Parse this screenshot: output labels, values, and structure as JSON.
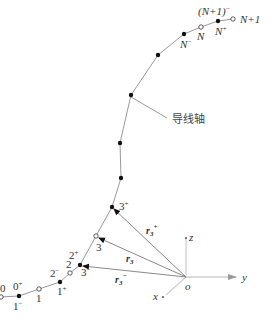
{
  "diagram": {
    "axis_label": "导线轴",
    "colors": {
      "line": "#9a9a9a",
      "node_filled": "#111111",
      "node_open": "#ffffff",
      "text": "#333333",
      "axis": "#cfcfcf"
    },
    "nodes": [
      {
        "id": "0",
        "type": "open",
        "labels": [
          "0"
        ]
      },
      {
        "id": "0p1m",
        "type": "filled",
        "labels": [
          "0",
          "+",
          "1",
          "−"
        ]
      },
      {
        "id": "1",
        "type": "open",
        "labels": [
          "1"
        ]
      },
      {
        "id": "1p2m",
        "type": "filled",
        "labels": [
          "1",
          "+",
          "2",
          "−"
        ]
      },
      {
        "id": "2",
        "type": "open",
        "labels": [
          "2"
        ]
      },
      {
        "id": "2p3m",
        "type": "filled",
        "labels": [
          "2",
          "+",
          "3",
          "−"
        ]
      },
      {
        "id": "3",
        "type": "open",
        "labels": [
          "3"
        ]
      },
      {
        "id": "3p",
        "type": "filled",
        "labels": [
          "3",
          "+"
        ]
      },
      {
        "id": "m1",
        "type": "filled",
        "labels": []
      },
      {
        "id": "m2",
        "type": "filled",
        "labels": []
      },
      {
        "id": "m3",
        "type": "filled",
        "labels": []
      },
      {
        "id": "m4",
        "type": "filled",
        "labels": []
      },
      {
        "id": "Nm",
        "type": "filled",
        "labels": [
          "N",
          "−"
        ]
      },
      {
        "id": "N",
        "type": "open",
        "labels": [
          "N"
        ]
      },
      {
        "id": "Np",
        "type": "filled",
        "labels": [
          "N",
          "+"
        ]
      },
      {
        "id": "N1",
        "type": "open",
        "labels": [
          "N+1",
          "(N+1)",
          "−"
        ]
      }
    ],
    "labels": {
      "n0": "0",
      "n0p": "0",
      "n1m": "1",
      "n1": "1",
      "n1p": "1",
      "n2m": "2",
      "n2": "2",
      "n2p": "2",
      "n3m": "3",
      "n3": "3",
      "n3p": "3",
      "nNm": "N",
      "nN": "N",
      "nNp": "N",
      "nN1": "N+1",
      "nN1m": "(N+1)",
      "plus": "+",
      "minus": "−"
    },
    "vectors": [
      {
        "name": "r",
        "sub": "3",
        "sup": "+"
      },
      {
        "name": "r",
        "sub": "3",
        "sup": ""
      },
      {
        "name": "r",
        "sub": "3",
        "sup": "−"
      }
    ],
    "axes": {
      "origin": "o",
      "x": "x",
      "y": "y",
      "z": "z"
    }
  }
}
